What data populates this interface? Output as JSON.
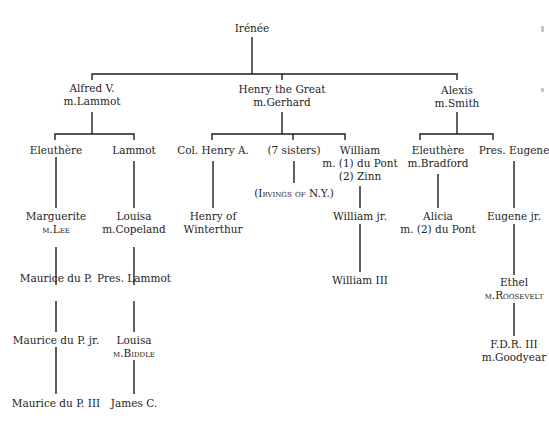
{
  "diagram": {
    "type": "family-tree",
    "root": "Irénée",
    "nodes": {
      "irenee": {
        "lines": [
          "Irénée"
        ]
      },
      "alfred": {
        "lines": [
          "Alfred V.",
          "m.Lammot"
        ]
      },
      "henry_great": {
        "lines": [
          "Henry the Great",
          "m.Gerhard"
        ]
      },
      "alexis": {
        "lines": [
          "Alexis",
          "m.Smith"
        ]
      },
      "eleuthere1": {
        "lines": [
          "Eleuthère"
        ]
      },
      "lammot": {
        "lines": [
          "Lammot"
        ]
      },
      "col_henry": {
        "lines": [
          "Col. Henry A."
        ]
      },
      "sisters": {
        "lines": [
          "(7 sisters)"
        ]
      },
      "william": {
        "lines": [
          "William",
          "m. (1) du Pont",
          "(2) Zinn"
        ]
      },
      "eleuthere2": {
        "lines": [
          "Eleuthère",
          "m.Bradford"
        ]
      },
      "pres_eugene": {
        "lines": [
          "Pres. Eugene"
        ]
      },
      "marguerite": {
        "lines": [
          "Marguerite",
          "m.Lee"
        ]
      },
      "louisa_copeland": {
        "lines": [
          "Louisa",
          "m.Copeland"
        ]
      },
      "henry_winterthur": {
        "lines": [
          "Henry of",
          "Winterthur"
        ]
      },
      "irvings": {
        "lines": [
          "(Irvings of N.Y.)"
        ]
      },
      "william_jr": {
        "lines": [
          "William jr."
        ]
      },
      "alicia": {
        "lines": [
          "Alicia",
          "m. (2) du Pont"
        ]
      },
      "eugene_jr": {
        "lines": [
          "Eugene jr."
        ]
      },
      "maurice": {
        "lines": [
          "Maurice du P."
        ]
      },
      "pres_lammot": {
        "lines": [
          "Pres. Lammot"
        ]
      },
      "william_iii": {
        "lines": [
          "William III"
        ]
      },
      "ethel": {
        "lines": [
          "Ethel",
          "m.Roosevelt"
        ]
      },
      "maurice_jr": {
        "lines": [
          "Maurice du P. jr."
        ]
      },
      "louisa_biddle": {
        "lines": [
          "Louisa",
          "m.Biddle"
        ]
      },
      "fdr_iii": {
        "lines": [
          "F.D.R. III",
          "m.Goodyear"
        ]
      },
      "maurice_iii": {
        "lines": [
          "Maurice du P. III"
        ]
      },
      "james": {
        "lines": [
          "James C."
        ]
      }
    },
    "edges": [
      [
        "irenee",
        "alfred"
      ],
      [
        "irenee",
        "henry_great"
      ],
      [
        "irenee",
        "alexis"
      ],
      [
        "alfred",
        "eleuthere1"
      ],
      [
        "alfred",
        "lammot"
      ],
      [
        "henry_great",
        "col_henry"
      ],
      [
        "henry_great",
        "sisters"
      ],
      [
        "henry_great",
        "william"
      ],
      [
        "alexis",
        "eleuthere2"
      ],
      [
        "alexis",
        "pres_eugene"
      ],
      [
        "eleuthere1",
        "marguerite"
      ],
      [
        "lammot",
        "louisa_copeland"
      ],
      [
        "col_henry",
        "henry_winterthur"
      ],
      [
        "sisters",
        "irvings"
      ],
      [
        "william",
        "william_jr"
      ],
      [
        "eleuthere2",
        "alicia"
      ],
      [
        "pres_eugene",
        "eugene_jr"
      ],
      [
        "marguerite",
        "maurice"
      ],
      [
        "louisa_copeland",
        "pres_lammot"
      ],
      [
        "william_jr",
        "william_iii"
      ],
      [
        "eugene_jr",
        "ethel"
      ],
      [
        "maurice",
        "maurice_jr"
      ],
      [
        "pres_lammot",
        "louisa_biddle"
      ],
      [
        "ethel",
        "fdr_iii"
      ],
      [
        "maurice_jr",
        "maurice_iii"
      ],
      [
        "louisa_biddle",
        "james"
      ]
    ]
  }
}
